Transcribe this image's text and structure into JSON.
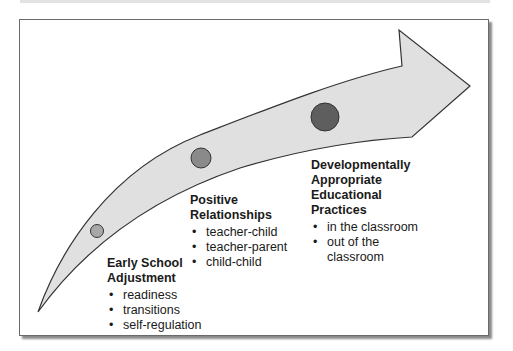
{
  "diagram": {
    "type": "curved-progress-arrow",
    "colors": {
      "arrow_fill": "#e0e0e0",
      "arrow_stroke": "#333333",
      "circle_small": "#a8a8a8",
      "circle_medium": "#8a8a8a",
      "circle_large": "#5e5e5e"
    },
    "stages": [
      {
        "title_lines": [
          "Early School",
          "Adjustment"
        ],
        "items": [
          "readiness",
          "transitions",
          "self-regulation"
        ]
      },
      {
        "title_lines": [
          "Positive",
          "Relationships"
        ],
        "items": [
          "teacher-child",
          "teacher-parent",
          "child-child"
        ]
      },
      {
        "title_lines": [
          "Developmentally",
          "Appropriate",
          "Educational",
          "Practices"
        ],
        "items": [
          "in the classroom",
          "out of the classroom"
        ]
      }
    ]
  }
}
